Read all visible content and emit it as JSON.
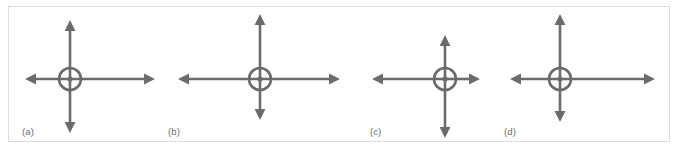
{
  "figure": {
    "kind": "vector-diagram-set",
    "panel_count": 4,
    "background_color": "#ffffff",
    "frame_color": "#dcdcdc",
    "stroke_color": "#6b6b6b",
    "hub_fill_color": "#6b6b6b",
    "stroke_width": 2.6,
    "label_color": "#6b6b6b"
  },
  "panels": [
    {
      "id": "a",
      "label": "(a)",
      "label_x": 22,
      "label_y": 126,
      "center": {
        "x": 70,
        "y": 79
      },
      "hub_radius": 11,
      "hub_dot_radius": 2.6,
      "arrows": {
        "up": {
          "direction": "up",
          "tip": {
            "x": 70,
            "y": 20
          },
          "length": 59
        },
        "down": {
          "direction": "down",
          "tip": {
            "x": 70,
            "y": 133
          },
          "length": 54
        },
        "left": {
          "direction": "left",
          "tip": {
            "x": 25,
            "y": 79
          },
          "length": 45
        },
        "right": {
          "direction": "right",
          "tip": {
            "x": 155,
            "y": 79
          },
          "length": 85
        }
      }
    },
    {
      "id": "b",
      "label": "(b)",
      "label_x": 168,
      "label_y": 126,
      "center": {
        "x": 260,
        "y": 79
      },
      "hub_radius": 11,
      "hub_dot_radius": 2.6,
      "arrows": {
        "up": {
          "direction": "up",
          "tip": {
            "x": 260,
            "y": 14
          },
          "length": 65
        },
        "down": {
          "direction": "down",
          "tip": {
            "x": 260,
            "y": 120
          },
          "length": 41
        },
        "left": {
          "direction": "left",
          "tip": {
            "x": 178,
            "y": 79
          },
          "length": 82
        },
        "right": {
          "direction": "right",
          "tip": {
            "x": 340,
            "y": 79
          },
          "length": 80
        }
      }
    },
    {
      "id": "c",
      "label": "(c)",
      "label_x": 370,
      "label_y": 126,
      "center": {
        "x": 445,
        "y": 79
      },
      "hub_radius": 11,
      "hub_dot_radius": 2.6,
      "arrows": {
        "up": {
          "direction": "up",
          "tip": {
            "x": 445,
            "y": 35
          },
          "length": 44
        },
        "down": {
          "direction": "down",
          "tip": {
            "x": 445,
            "y": 138
          },
          "length": 59
        },
        "left": {
          "direction": "left",
          "tip": {
            "x": 372,
            "y": 79
          },
          "length": 73
        },
        "right": {
          "direction": "right",
          "tip": {
            "x": 480,
            "y": 79
          },
          "length": 35
        }
      }
    },
    {
      "id": "d",
      "label": "(d)",
      "label_x": 504,
      "label_y": 126,
      "center": {
        "x": 560,
        "y": 79
      },
      "hub_radius": 11,
      "hub_dot_radius": 2.6,
      "arrows": {
        "up": {
          "direction": "up",
          "tip": {
            "x": 560,
            "y": 14
          },
          "length": 65
        },
        "down": {
          "direction": "down",
          "tip": {
            "x": 560,
            "y": 122
          },
          "length": 43
        },
        "left": {
          "direction": "left",
          "tip": {
            "x": 510,
            "y": 79
          },
          "length": 50
        },
        "right": {
          "direction": "right",
          "tip": {
            "x": 655,
            "y": 79
          },
          "length": 95
        }
      }
    }
  ]
}
